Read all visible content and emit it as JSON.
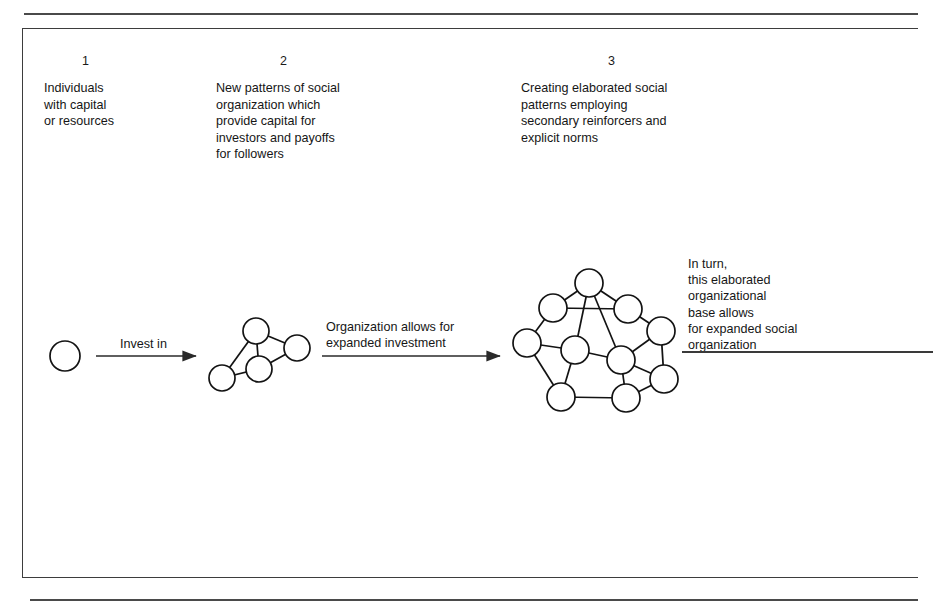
{
  "figure": {
    "columns": [
      {
        "number": "1",
        "text": "Individuals\nwith capital\nor resources"
      },
      {
        "number": "2",
        "text": "New patterns of social\norganization which\nprovide capital for\ninvestors and payoffs\nfor followers"
      },
      {
        "number": "3",
        "text": "Creating elaborated social\npatterns employing\nsecondary reinforcers and\nexplicit norms"
      }
    ],
    "flow_labels": {
      "invest": "Invest in",
      "organization_allows": "Organization allows for\nexpanded investment",
      "in_turn": "In turn,\nthis elaborated\norganizational\nbase allows\nfor expanded social\norganization"
    },
    "colors": {
      "ink": "#131313",
      "rule": "#4a4a4a",
      "frame": "#3d3d3d",
      "paper": "#ffffff"
    },
    "graphics": {
      "single_node": {
        "cx": 65,
        "cy": 356,
        "r": 15
      },
      "small_network": {
        "node_r": 13,
        "nodes": [
          {
            "id": "s-top",
            "cx": 256,
            "cy": 331
          },
          {
            "id": "s-right",
            "cx": 297,
            "cy": 348
          },
          {
            "id": "s-center",
            "cx": 259,
            "cy": 369
          },
          {
            "id": "s-left",
            "cx": 222,
            "cy": 378
          }
        ],
        "edges": [
          [
            "s-top",
            "s-right"
          ],
          [
            "s-top",
            "s-center"
          ],
          [
            "s-top",
            "s-left"
          ],
          [
            "s-right",
            "s-center"
          ],
          [
            "s-center",
            "s-left"
          ]
        ]
      },
      "large_network": {
        "node_r": 14,
        "nodes": [
          {
            "id": "n-top",
            "cx": 589,
            "cy": 283
          },
          {
            "id": "n-ul",
            "cx": 553,
            "cy": 308
          },
          {
            "id": "n-ur",
            "cx": 628,
            "cy": 309
          },
          {
            "id": "n-l",
            "cx": 527,
            "cy": 343
          },
          {
            "id": "n-r",
            "cx": 661,
            "cy": 331
          },
          {
            "id": "n-midl",
            "cx": 575,
            "cy": 350
          },
          {
            "id": "n-midr",
            "cx": 621,
            "cy": 360
          },
          {
            "id": "n-lr",
            "cx": 664,
            "cy": 379
          },
          {
            "id": "n-bl",
            "cx": 561,
            "cy": 397
          },
          {
            "id": "n-br",
            "cx": 626,
            "cy": 398
          }
        ],
        "edges": [
          [
            "n-top",
            "n-ul"
          ],
          [
            "n-top",
            "n-ur"
          ],
          [
            "n-top",
            "n-midl"
          ],
          [
            "n-top",
            "n-midr"
          ],
          [
            "n-ul",
            "n-ur"
          ],
          [
            "n-ul",
            "n-l"
          ],
          [
            "n-ur",
            "n-r"
          ],
          [
            "n-l",
            "n-midl"
          ],
          [
            "n-l",
            "n-bl"
          ],
          [
            "n-r",
            "n-midr"
          ],
          [
            "n-r",
            "n-lr"
          ],
          [
            "n-midl",
            "n-midr"
          ],
          [
            "n-midl",
            "n-bl"
          ],
          [
            "n-midr",
            "n-lr"
          ],
          [
            "n-midr",
            "n-br"
          ],
          [
            "n-lr",
            "n-br"
          ],
          [
            "n-bl",
            "n-br"
          ]
        ]
      },
      "arrows": [
        {
          "id": "arrow-invest",
          "x1": 96,
          "y1": 356,
          "x2": 196,
          "y2": 356,
          "arrowhead": true
        },
        {
          "id": "arrow-orgallow",
          "x1": 322,
          "y1": 356,
          "x2": 500,
          "y2": 356,
          "arrowhead": true
        }
      ],
      "lines": [
        {
          "id": "line-inturn",
          "x1": 682,
          "y1": 352,
          "x2": 933,
          "y2": 352,
          "arrowhead": false
        }
      ]
    }
  }
}
